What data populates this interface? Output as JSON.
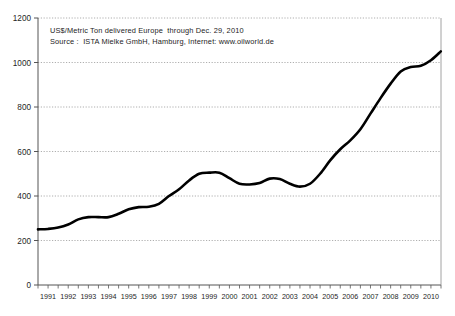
{
  "chart_data": {
    "type": "line",
    "title": "",
    "subtitle": "",
    "annotations": [
      "US$/Metric Ton delivered Europe  through Dec. 29, 2010",
      "Source :  ISTA Mielke GmbH, Hamburg, Internet: www.oilworld.de"
    ],
    "xlabel": "",
    "ylabel": "",
    "xlim": [
      1991,
      2011
    ],
    "ylim": [
      0,
      1200
    ],
    "yticks": [
      0,
      200,
      400,
      600,
      800,
      1000,
      1200
    ],
    "ytick_labels": [
      "0",
      "200",
      "400",
      "600",
      "800",
      "1000",
      "1200"
    ],
    "xticks": [
      1991,
      1992,
      1993,
      1994,
      1995,
      1996,
      1997,
      1998,
      1999,
      2000,
      2001,
      2002,
      2003,
      2004,
      2005,
      2006,
      2007,
      2008,
      2009,
      2010
    ],
    "xtick_labels": [
      "1991",
      "1992",
      "1993",
      "1994",
      "1995",
      "1996",
      "1997",
      "1998",
      "1999",
      "2000",
      "2001",
      "2002",
      "2003",
      "2004",
      "2005",
      "2006",
      "2007",
      "2008",
      "2009",
      "2010"
    ],
    "minor_xticks_per_year": 2,
    "grid": "horizontal-dotted",
    "legend": "none",
    "line_color": "#000000",
    "line_width": 2.6,
    "grid_color": "#9a9a9a",
    "axis_color": "#555555",
    "series": [
      {
        "name": "Palm oil price",
        "x": [
          1991.0,
          1991.5,
          1992.0,
          1992.5,
          1993.0,
          1993.5,
          1994.0,
          1994.5,
          1995.0,
          1995.5,
          1996.0,
          1996.5,
          1997.0,
          1997.5,
          1998.0,
          1998.5,
          1999.0,
          1999.5,
          2000.0,
          2000.5,
          2001.0,
          2001.5,
          2002.0,
          2002.5,
          2003.0,
          2003.5,
          2004.0,
          2004.5,
          2005.0,
          2005.5,
          2006.0,
          2006.5,
          2007.0,
          2007.5,
          2008.0,
          2008.5,
          2009.0,
          2009.5,
          2010.0,
          2010.5,
          2010.99
        ],
        "values": [
          250,
          252,
          258,
          272,
          295,
          305,
          305,
          305,
          320,
          340,
          350,
          352,
          365,
          400,
          430,
          470,
          500,
          505,
          505,
          480,
          455,
          452,
          458,
          478,
          476,
          455,
          442,
          455,
          500,
          560,
          610,
          650,
          700,
          770,
          840,
          905,
          960,
          980,
          985,
          1010,
          1050
        ]
      }
    ]
  }
}
